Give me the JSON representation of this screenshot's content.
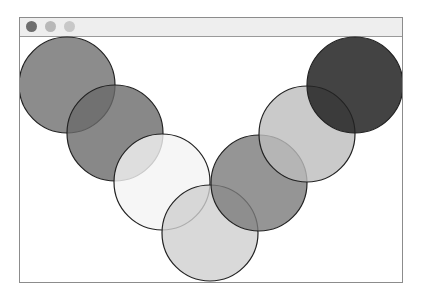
{
  "window": {
    "title": "",
    "controls": [
      {
        "name": "close",
        "color": "#6e6e6e"
      },
      {
        "name": "minimize",
        "color": "#b8b8b8"
      },
      {
        "name": "maximize",
        "color": "#c8c8c8"
      }
    ]
  },
  "canvas": {
    "circles": [
      {
        "cx": 67,
        "cy": 85,
        "r": 48,
        "fill": "#6f6f6f",
        "opacity": 0.8
      },
      {
        "cx": 115,
        "cy": 133,
        "r": 48,
        "fill": "#6a6a6a",
        "opacity": 0.8
      },
      {
        "cx": 162,
        "cy": 182,
        "r": 48,
        "fill": "#f4f4f4",
        "opacity": 0.8
      },
      {
        "cx": 210,
        "cy": 233,
        "r": 48,
        "fill": "#cfcfcf",
        "opacity": 0.8
      },
      {
        "cx": 259,
        "cy": 183,
        "r": 48,
        "fill": "#7a7a7a",
        "opacity": 0.8
      },
      {
        "cx": 307,
        "cy": 134,
        "r": 48,
        "fill": "#bdbdbd",
        "opacity": 0.8
      },
      {
        "cx": 355,
        "cy": 85,
        "r": 48,
        "fill": "#222222",
        "opacity": 0.85
      }
    ],
    "stroke": "#222222"
  }
}
